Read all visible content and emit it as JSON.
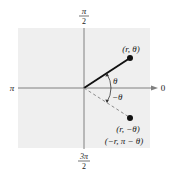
{
  "diagram": {
    "type": "polar-coordinate-symmetry",
    "axis_labels": {
      "top_num": "π",
      "top_den": "2",
      "bottom_num": "3π",
      "bottom_den": "2",
      "left": "π",
      "right": "0"
    },
    "angle_labels": {
      "theta": "θ",
      "neg_theta": "−θ"
    },
    "points": [
      {
        "label": "(r, θ)"
      },
      {
        "label": "(r, −θ)",
        "label2": "(−r, π − θ)"
      }
    ],
    "colors": {
      "background": "#ffffff",
      "grid_fill": "#efefef",
      "axis": "#808080",
      "ray": "#111111",
      "dashed_ray": "#8a8a8a",
      "point": "#111111",
      "text": "#1a1a1a"
    }
  }
}
